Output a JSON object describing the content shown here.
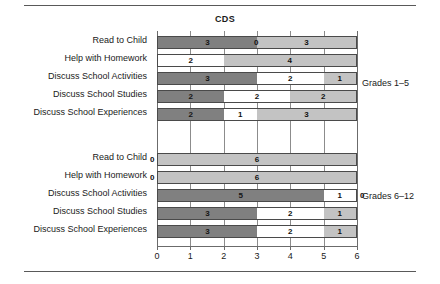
{
  "chart_data": {
    "type": "bar",
    "orientation": "horizontal",
    "stacked": true,
    "title": "CDS",
    "xlabel": "",
    "ylabel": "",
    "xlim": [
      0,
      6
    ],
    "xticks": [
      0,
      1,
      2,
      3,
      4,
      5,
      6
    ],
    "xtick_labels": [
      "0",
      "1",
      "2",
      "3",
      "4",
      "5",
      "6"
    ],
    "grid": true,
    "legend": null,
    "colors": {
      "dark": "#808080",
      "light": "#c3c3c3",
      "white": "#ffffff",
      "outline": "#4a4a4a",
      "gridline": "#8c8c8c",
      "text": "#1a1a1a"
    },
    "categories": [
      "Read to Child",
      "Help with Homework",
      "Discuss School Activities",
      "Discuss School Studies",
      "Discuss School Experiences"
    ],
    "groups": [
      {
        "name": "Grades 1-5",
        "label": "Grades 1–5",
        "rows": [
          {
            "category": "Read to Child",
            "segments": [
              {
                "value": 3,
                "label": "3",
                "shade": "dark",
                "start": 0,
                "end": 3
              },
              {
                "value": 0,
                "label": "0",
                "shade": "none",
                "start": 3,
                "end": 3
              },
              {
                "value": 3,
                "label": "3",
                "shade": "light",
                "start": 3,
                "end": 6
              }
            ]
          },
          {
            "category": "Help with Homework",
            "segments": [
              {
                "value": 2,
                "label": "2",
                "shade": "white",
                "start": 0,
                "end": 2
              },
              {
                "value": 4,
                "label": "4",
                "shade": "light",
                "start": 2,
                "end": 6
              }
            ]
          },
          {
            "category": "Discuss School Activities",
            "segments": [
              {
                "value": 3,
                "label": "3",
                "shade": "dark",
                "start": 0,
                "end": 3
              },
              {
                "value": 2,
                "label": "2",
                "shade": "white",
                "start": 3,
                "end": 5
              },
              {
                "value": 1,
                "label": "1",
                "shade": "light",
                "start": 5,
                "end": 6
              }
            ]
          },
          {
            "category": "Discuss School Studies",
            "segments": [
              {
                "value": 2,
                "label": "2",
                "shade": "dark",
                "start": 0,
                "end": 2
              },
              {
                "value": 2,
                "label": "2",
                "shade": "white",
                "start": 2,
                "end": 4
              },
              {
                "value": 2,
                "label": "2",
                "shade": "light",
                "start": 4,
                "end": 6
              }
            ]
          },
          {
            "category": "Discuss School Experiences",
            "segments": [
              {
                "value": 2,
                "label": "2",
                "shade": "dark",
                "start": 0,
                "end": 2
              },
              {
                "value": 1,
                "label": "1",
                "shade": "white",
                "start": 2,
                "end": 3
              },
              {
                "value": 3,
                "label": "3",
                "shade": "light",
                "start": 3,
                "end": 6
              }
            ]
          }
        ]
      },
      {
        "name": "Grades 6-12",
        "label": "Grades 6–12",
        "rows": [
          {
            "category": "Read to Child",
            "segments": [
              {
                "value": 0,
                "label": "0",
                "shade": "none",
                "start": 0,
                "end": 0
              },
              {
                "value": 6,
                "label": "6",
                "shade": "light",
                "start": 0,
                "end": 6
              }
            ]
          },
          {
            "category": "Help with Homework",
            "segments": [
              {
                "value": 0,
                "label": "0",
                "shade": "none",
                "start": 0,
                "end": 0
              },
              {
                "value": 6,
                "label": "6",
                "shade": "light",
                "start": 0,
                "end": 6
              }
            ]
          },
          {
            "category": "Discuss School Activities",
            "segments": [
              {
                "value": 5,
                "label": "5",
                "shade": "dark",
                "start": 0,
                "end": 5
              },
              {
                "value": 1,
                "label": "1",
                "shade": "white",
                "start": 5,
                "end": 6
              },
              {
                "value": 0,
                "label": "0",
                "shade": "none",
                "start": 6,
                "end": 6
              }
            ]
          },
          {
            "category": "Discuss School Studies",
            "segments": [
              {
                "value": 3,
                "label": "3",
                "shade": "dark",
                "start": 0,
                "end": 3
              },
              {
                "value": 2,
                "label": "2",
                "shade": "white",
                "start": 3,
                "end": 5
              },
              {
                "value": 1,
                "label": "1",
                "shade": "light",
                "start": 5,
                "end": 6
              }
            ]
          },
          {
            "category": "Discuss School Experiences",
            "segments": [
              {
                "value": 3,
                "label": "3",
                "shade": "dark",
                "start": 0,
                "end": 3
              },
              {
                "value": 2,
                "label": "2",
                "shade": "white",
                "start": 3,
                "end": 5
              },
              {
                "value": 1,
                "label": "1",
                "shade": "light",
                "start": 5,
                "end": 6
              }
            ]
          }
        ]
      }
    ]
  }
}
